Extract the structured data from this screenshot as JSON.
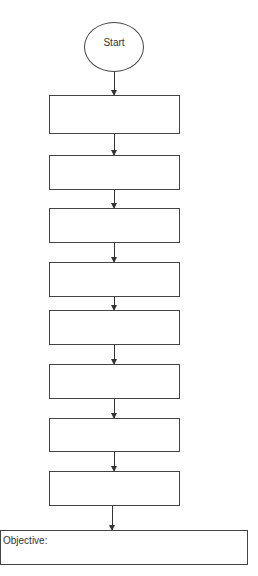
{
  "diagram": {
    "type": "flowchart",
    "start": {
      "label": "Start"
    },
    "steps": [
      {
        "label": ""
      },
      {
        "label": ""
      },
      {
        "label": ""
      },
      {
        "label": ""
      },
      {
        "label": ""
      },
      {
        "label": ""
      },
      {
        "label": ""
      },
      {
        "label": ""
      }
    ],
    "end": {
      "label": "Objective:"
    }
  }
}
